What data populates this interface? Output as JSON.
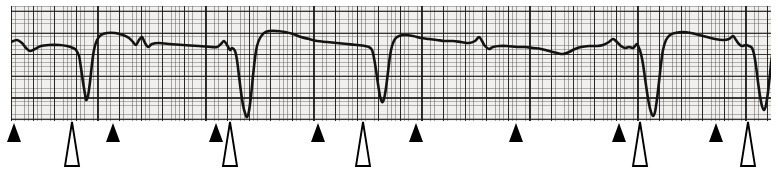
{
  "figure": {
    "type": "ecg-rhythm-strip",
    "width": 778,
    "height": 182,
    "paper": {
      "left": 11,
      "top": 6,
      "width": 760,
      "height": 115,
      "background_color": "#f2f0ee",
      "fine_grid_color": "#5a5856",
      "major_grid_color": "#191716",
      "fine_grid_spacing_px": 4.32,
      "major_grid_spacing_px": 21.6,
      "major_grid_offset_y_px": 5
    },
    "trace": {
      "color": "#131313",
      "stroke_width": 2.6,
      "baseline_y": 40,
      "label": "ecg-waveform"
    }
  },
  "chart_data": {
    "type": "line",
    "title": "",
    "xlabel": "",
    "ylabel": "",
    "grid": true,
    "legend": null,
    "xlim": [
      0,
      760
    ],
    "ylim": [
      115,
      0
    ],
    "series": [
      {
        "name": "ECG lead trace",
        "points": [
          [
            0,
            36
          ],
          [
            6,
            34
          ],
          [
            11,
            37
          ],
          [
            15,
            42
          ],
          [
            19,
            45
          ],
          [
            24,
            43
          ],
          [
            30,
            40
          ],
          [
            38,
            39
          ],
          [
            48,
            39
          ],
          [
            56,
            40
          ],
          [
            62,
            42
          ],
          [
            65,
            44
          ],
          [
            68,
            50
          ],
          [
            70,
            62
          ],
          [
            72,
            76
          ],
          [
            74,
            88
          ],
          [
            75,
            94
          ],
          [
            77,
            90
          ],
          [
            79,
            76
          ],
          [
            81,
            58
          ],
          [
            83,
            44
          ],
          [
            86,
            34
          ],
          [
            90,
            29
          ],
          [
            96,
            27
          ],
          [
            104,
            27
          ],
          [
            112,
            29
          ],
          [
            118,
            32
          ],
          [
            122,
            36
          ],
          [
            125,
            39
          ],
          [
            128,
            34
          ],
          [
            131,
            31
          ],
          [
            134,
            37
          ],
          [
            137,
            41
          ],
          [
            141,
            38
          ],
          [
            148,
            37
          ],
          [
            158,
            38
          ],
          [
            172,
            39
          ],
          [
            188,
            40
          ],
          [
            200,
            41
          ],
          [
            206,
            41
          ],
          [
            210,
            38
          ],
          [
            213,
            35
          ],
          [
            216,
            39
          ],
          [
            219,
            44
          ],
          [
            221,
            42
          ],
          [
            224,
            45
          ],
          [
            226,
            54
          ],
          [
            228,
            70
          ],
          [
            230,
            86
          ],
          [
            232,
            99
          ],
          [
            234,
            107
          ],
          [
            236,
            111
          ],
          [
            238,
            105
          ],
          [
            240,
            90
          ],
          [
            242,
            70
          ],
          [
            244,
            52
          ],
          [
            246,
            40
          ],
          [
            249,
            32
          ],
          [
            253,
            27
          ],
          [
            258,
            25
          ],
          [
            266,
            25
          ],
          [
            274,
            26
          ],
          [
            282,
            28
          ],
          [
            290,
            31
          ],
          [
            298,
            33
          ],
          [
            306,
            35
          ],
          [
            316,
            36
          ],
          [
            326,
            37
          ],
          [
            336,
            38
          ],
          [
            346,
            39
          ],
          [
            354,
            40
          ],
          [
            358,
            41
          ],
          [
            361,
            44
          ],
          [
            363,
            52
          ],
          [
            365,
            64
          ],
          [
            367,
            78
          ],
          [
            369,
            90
          ],
          [
            371,
            96
          ],
          [
            373,
            93
          ],
          [
            375,
            82
          ],
          [
            377,
            66
          ],
          [
            379,
            50
          ],
          [
            381,
            40
          ],
          [
            384,
            33
          ],
          [
            388,
            30
          ],
          [
            394,
            29
          ],
          [
            402,
            30
          ],
          [
            410,
            32
          ],
          [
            418,
            33
          ],
          [
            426,
            34
          ],
          [
            434,
            35
          ],
          [
            442,
            35
          ],
          [
            450,
            36
          ],
          [
            458,
            37
          ],
          [
            464,
            35
          ],
          [
            468,
            31
          ],
          [
            471,
            35
          ],
          [
            474,
            40
          ],
          [
            478,
            43
          ],
          [
            482,
            41
          ],
          [
            488,
            40
          ],
          [
            496,
            40
          ],
          [
            506,
            41
          ],
          [
            514,
            41
          ],
          [
            522,
            42
          ],
          [
            530,
            43
          ],
          [
            538,
            45
          ],
          [
            546,
            47
          ],
          [
            552,
            48
          ],
          [
            558,
            46
          ],
          [
            564,
            43
          ],
          [
            570,
            41
          ],
          [
            578,
            40
          ],
          [
            586,
            40
          ],
          [
            592,
            39
          ],
          [
            598,
            36
          ],
          [
            602,
            33
          ],
          [
            606,
            36
          ],
          [
            610,
            40
          ],
          [
            614,
            42
          ],
          [
            618,
            41
          ],
          [
            622,
            42
          ],
          [
            624,
            40
          ],
          [
            626,
            38
          ],
          [
            628,
            42
          ],
          [
            630,
            48
          ],
          [
            632,
            58
          ],
          [
            634,
            72
          ],
          [
            636,
            86
          ],
          [
            638,
            98
          ],
          [
            640,
            106
          ],
          [
            642,
            110
          ],
          [
            644,
            106
          ],
          [
            646,
            93
          ],
          [
            648,
            76
          ],
          [
            650,
            58
          ],
          [
            652,
            44
          ],
          [
            655,
            34
          ],
          [
            659,
            29
          ],
          [
            664,
            27
          ],
          [
            672,
            26
          ],
          [
            680,
            27
          ],
          [
            688,
            29
          ],
          [
            696,
            31
          ],
          [
            704,
            33
          ],
          [
            712,
            34
          ],
          [
            718,
            33
          ],
          [
            722,
            30
          ],
          [
            725,
            34
          ],
          [
            728,
            38
          ],
          [
            731,
            40
          ],
          [
            735,
            39
          ],
          [
            738,
            40
          ],
          [
            741,
            42
          ],
          [
            743,
            48
          ],
          [
            745,
            60
          ],
          [
            747,
            76
          ],
          [
            749,
            90
          ],
          [
            751,
            100
          ],
          [
            753,
            104
          ],
          [
            755,
            99
          ],
          [
            757,
            86
          ],
          [
            759,
            68
          ],
          [
            761,
            50
          ],
          [
            764,
            38
          ],
          [
            768,
            31
          ],
          [
            773,
            28
          ],
          [
            780,
            27
          ]
        ]
      }
    ],
    "annotations": {
      "solid_markers": {
        "name": "solid-arrowhead-marker",
        "meaning": "p-wave-marker",
        "color": "#000000",
        "count": 9,
        "x_positions": [
          14,
          113,
          216,
          318,
          416,
          516,
          619,
          716
        ]
      },
      "hollow_markers": {
        "name": "hollow-arrow-marker",
        "meaning": "qrs-complex-marker",
        "color": "#000000",
        "count": 6,
        "x_positions": [
          72,
          229,
          363,
          640,
          748
        ]
      }
    }
  },
  "markers": [
    {
      "id": "solid-marker-1",
      "type": "solid",
      "x": 14,
      "label": "solid-arrowhead-marker-1"
    },
    {
      "id": "hollow-marker-1",
      "type": "hollow",
      "x": 72,
      "label": "hollow-arrow-marker-1"
    },
    {
      "id": "solid-marker-2",
      "type": "solid",
      "x": 113,
      "label": "solid-arrowhead-marker-2"
    },
    {
      "id": "solid-marker-3",
      "type": "solid",
      "x": 216,
      "label": "solid-arrowhead-marker-3"
    },
    {
      "id": "hollow-marker-2",
      "type": "hollow",
      "x": 230,
      "label": "hollow-arrow-marker-2"
    },
    {
      "id": "solid-marker-4",
      "type": "solid",
      "x": 318,
      "label": "solid-arrowhead-marker-4"
    },
    {
      "id": "hollow-marker-3",
      "type": "hollow",
      "x": 363,
      "label": "hollow-arrow-marker-3"
    },
    {
      "id": "solid-marker-5",
      "type": "solid",
      "x": 416,
      "label": "solid-arrowhead-marker-5"
    },
    {
      "id": "solid-marker-6",
      "type": "solid",
      "x": 516,
      "label": "solid-arrowhead-marker-6"
    },
    {
      "id": "solid-marker-7",
      "type": "solid",
      "x": 619,
      "label": "solid-arrowhead-marker-7"
    },
    {
      "id": "hollow-marker-4",
      "type": "hollow",
      "x": 640,
      "label": "hollow-arrow-marker-4"
    },
    {
      "id": "solid-marker-8",
      "type": "solid",
      "x": 716,
      "label": "solid-arrowhead-marker-8"
    },
    {
      "id": "hollow-marker-5",
      "type": "hollow",
      "x": 748,
      "label": "hollow-arrow-marker-5"
    }
  ]
}
